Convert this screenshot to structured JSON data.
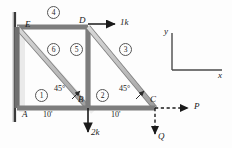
{
  "figure": {
    "type": "truss-free-body-diagram",
    "nodes": [
      {
        "id": "A",
        "label": "A",
        "x": 17,
        "y": 108
      },
      {
        "id": "B",
        "label": "B",
        "x": 88,
        "y": 108
      },
      {
        "id": "C",
        "label": "C",
        "x": 155,
        "y": 108
      },
      {
        "id": "D",
        "label": "D",
        "x": 88,
        "y": 27
      },
      {
        "id": "E",
        "label": "E",
        "x": 17,
        "y": 27
      }
    ],
    "members": [
      {
        "number": "1",
        "label": "①",
        "from": "A",
        "to": "B",
        "cx": 40,
        "cy": 94
      },
      {
        "number": "2",
        "label": "②",
        "from": "B",
        "to": "C",
        "cx": 101,
        "cy": 94
      },
      {
        "number": "3",
        "label": "③",
        "from": "D",
        "to": "C",
        "cx": 124,
        "cy": 48
      },
      {
        "number": "4",
        "label": "④",
        "from": "E",
        "to": "D",
        "cx": 52,
        "cy": 13
      },
      {
        "number": "5",
        "label": "⑤",
        "from": "D",
        "to": "B",
        "cx": 75,
        "cy": 48
      },
      {
        "number": "6",
        "label": "⑥",
        "from": "E",
        "to": "B",
        "cx": 52,
        "cy": 48
      }
    ],
    "angles": [
      {
        "value": "45°",
        "at": "B-left",
        "x": 54,
        "y": 85
      },
      {
        "value": "45°",
        "at": "C-left",
        "x": 120,
        "y": 85
      }
    ],
    "dimensions": [
      {
        "value": "10'",
        "span": "A-B",
        "x": 44,
        "y": 112
      },
      {
        "value": "10'",
        "span": "B-C",
        "x": 112,
        "y": 112
      }
    ],
    "loads": [
      {
        "label": "1k",
        "at": "D",
        "direction": "right",
        "x": 120,
        "y": 22
      },
      {
        "label": "2k",
        "at": "B",
        "direction": "down",
        "x": 92,
        "y": 132
      },
      {
        "label": "P",
        "at": "C",
        "direction": "right",
        "style": "dashed",
        "x": 196,
        "y": 104
      },
      {
        "label": "Q",
        "at": "C",
        "direction": "down",
        "style": "dashed",
        "x": 160,
        "y": 138
      }
    ],
    "axes": {
      "x_label": "x",
      "y_label": "y",
      "origin": {
        "x": 172,
        "y": 70
      },
      "x_end": {
        "x": 222,
        "y": 70
      },
      "y_end": {
        "x": 172,
        "y": 33
      }
    },
    "support": {
      "type": "fixed-wall",
      "side": "left",
      "x": 15
    }
  },
  "colors": {
    "member": "#b9b9b9",
    "member_edge": "#7d7d7d",
    "ink": "#1a1a1a",
    "wall": "#3a3a3a",
    "shadow": "#cfcfcf"
  }
}
